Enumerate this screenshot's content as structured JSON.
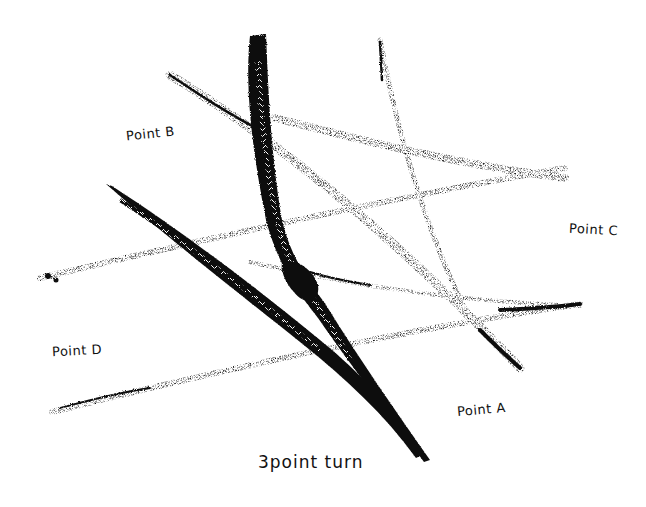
{
  "diagram": {
    "title": "3point turn",
    "ink_color": "#111111",
    "background": "#ffffff",
    "labels": {
      "point_a": "Point A",
      "point_b": "Point B",
      "point_c": "Point C",
      "point_d": "Point D"
    },
    "caption": "3point turn",
    "tracks": [
      {
        "name": "heavy-track-b-to-a",
        "from": [
          258,
          38
        ],
        "to": [
          428,
          460
        ],
        "weight": "heavy"
      },
      {
        "name": "diagonal-track-left",
        "from": [
          108,
          186
        ],
        "to": [
          420,
          455
        ],
        "weight": "heavy"
      },
      {
        "name": "upper-track-b-to-a",
        "from": [
          170,
          75
        ],
        "to": [
          520,
          368
        ],
        "weight": "medium"
      },
      {
        "name": "upper-track-to-c",
        "from": [
          280,
          118
        ],
        "to": [
          565,
          178
        ],
        "weight": "light"
      },
      {
        "name": "vertical-track",
        "from": [
          380,
          40
        ],
        "to": [
          470,
          320
        ],
        "weight": "light"
      },
      {
        "name": "middle-track-d-to-c",
        "from": [
          40,
          278
        ],
        "to": [
          565,
          168
        ],
        "weight": "light"
      },
      {
        "name": "lower-track-d-to-a",
        "from": [
          52,
          412
        ],
        "to": [
          580,
          304
        ],
        "weight": "light"
      }
    ]
  }
}
